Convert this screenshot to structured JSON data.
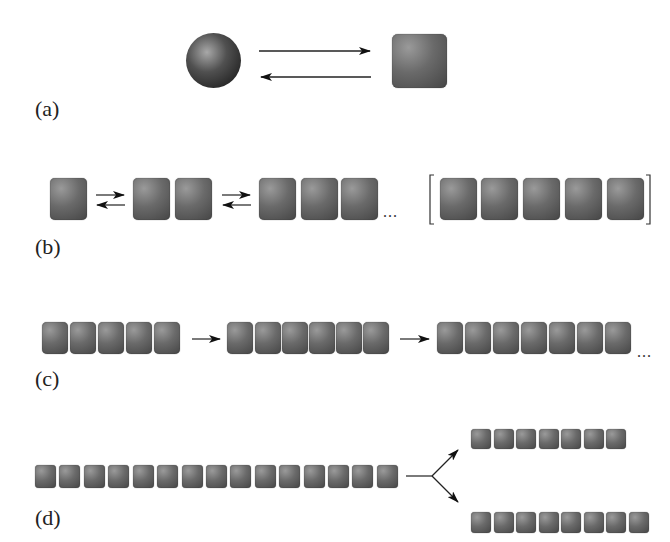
{
  "figure": {
    "panels": [
      {
        "label": "(a)",
        "description": "monomer sphere reversibly converts to square subunit"
      },
      {
        "label": "(b)",
        "description": "reversible stepwise addition: 1, 2, 3 ... subunits; bracketed nucleus of 5",
        "ellipsis": "...",
        "counts": [
          1,
          2,
          3,
          5
        ]
      },
      {
        "label": "(c)",
        "description": "irreversible elongation 5 → 6 → 7 ...",
        "ellipsis": "...",
        "counts": [
          5,
          6,
          7
        ]
      },
      {
        "label": "(d)",
        "description": "fragmentation of 15-mer into 7 and 8",
        "counts": [
          15,
          7,
          8
        ]
      }
    ]
  }
}
